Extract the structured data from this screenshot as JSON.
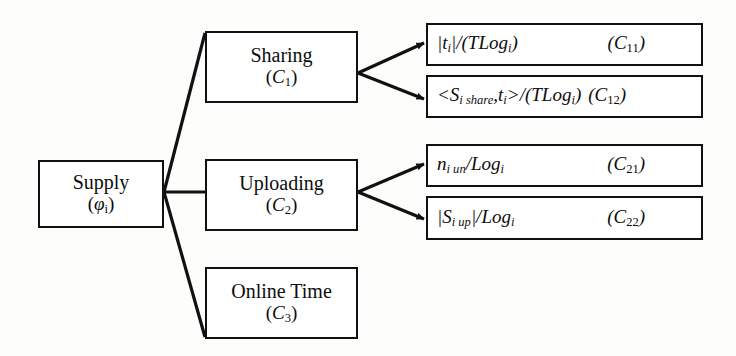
{
  "diagram": {
    "type": "tree",
    "stroke_color": "#111111",
    "background_color": "#fdfdfb",
    "text_color": "#0d0d0d"
  },
  "root": {
    "label": "Supply",
    "symbol": "(φi)",
    "symbol_base": "φ",
    "symbol_sub": "i"
  },
  "branches": [
    {
      "label": "Sharing",
      "symbol_base": "C",
      "symbol_sub": "1",
      "symbol": "(C1)"
    },
    {
      "label": "Uploading",
      "symbol_base": "C",
      "symbol_sub": "2",
      "symbol": "(C2)"
    },
    {
      "label": "Online Time",
      "symbol_base": "C",
      "symbol_sub": "3",
      "symbol": "(C3)"
    }
  ],
  "leaves": [
    {
      "expression": "|ti|/(TLogi)",
      "tag": "(C11)",
      "tag_base": "C",
      "tag_sub": "11",
      "parent": "Sharing"
    },
    {
      "expression": "<Si share,ti>/(TLogi)",
      "tag": "(C12)",
      "tag_base": "C",
      "tag_sub": "12",
      "parent": "Sharing"
    },
    {
      "expression": "ni un/Logi",
      "tag": "(C21)",
      "tag_base": "C",
      "tag_sub": "21",
      "parent": "Uploading"
    },
    {
      "expression": "|Si up|/Logi",
      "tag": "(C22)",
      "tag_base": "C",
      "tag_sub": "22",
      "parent": "Uploading"
    }
  ]
}
